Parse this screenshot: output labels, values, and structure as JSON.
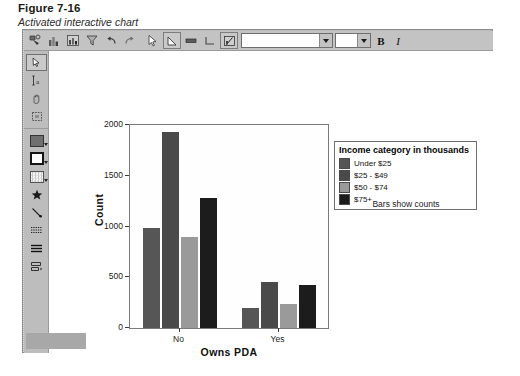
{
  "caption": {
    "figure_number": "Figure 7-16",
    "figure_title": "Activated interactive chart"
  },
  "toolbar": {
    "buttons": [
      {
        "name": "select-data-icon",
        "title": "Select Data"
      },
      {
        "name": "bar-chart-icon",
        "title": "Bar Chart"
      },
      {
        "name": "histogram-icon",
        "title": "Histogram"
      },
      {
        "name": "filter-icon",
        "title": "Filter"
      },
      {
        "name": "undo-icon",
        "title": "Undo"
      },
      {
        "name": "redo-icon",
        "title": "Redo"
      },
      {
        "name": "pointer-tool-icon",
        "title": "Arrow Tool"
      },
      {
        "name": "shape-tool-icon",
        "title": "Shape Tool"
      },
      {
        "name": "text-box-icon",
        "title": "Text Box"
      },
      {
        "name": "reference-line-icon",
        "title": "Reference Line"
      },
      {
        "name": "transpose-icon",
        "title": "Transpose Chart"
      }
    ],
    "font_value": "",
    "font_placeholder": "",
    "size_value": "",
    "bold_label": "B",
    "italic_label": "I"
  },
  "left_toolbar": {
    "items": [
      {
        "name": "arrow-select-icon"
      },
      {
        "name": "text-insert-icon"
      },
      {
        "name": "hand-pan-icon"
      },
      {
        "name": "marquee-select-icon"
      },
      {
        "name": "fill-color-icon"
      },
      {
        "name": "border-style-icon"
      },
      {
        "name": "fill-pattern-icon"
      },
      {
        "name": "marker-star-icon"
      },
      {
        "name": "line-style-icon"
      },
      {
        "name": "dash-pattern-icon"
      },
      {
        "name": "line-weight-icon"
      },
      {
        "name": "bar-label-icon"
      }
    ]
  },
  "chart_data": {
    "type": "bar",
    "title": "",
    "xlabel": "Owns PDA",
    "ylabel": "Count",
    "categories": [
      "No",
      "Yes"
    ],
    "series": [
      {
        "name": "Under $25",
        "values": [
          985,
          195
        ],
        "color": "#565656"
      },
      {
        "name": "$25 - $49",
        "values": [
          1930,
          455
        ],
        "color": "#4a4a4a"
      },
      {
        "name": "$50 - $74",
        "values": [
          895,
          235
        ],
        "color": "#9a9a9a"
      },
      {
        "name": "$75+",
        "values": [
          1280,
          425
        ],
        "color": "#1c1c1c"
      }
    ],
    "ylim": [
      0,
      2000
    ],
    "yticks": [
      0,
      500,
      1000,
      1500,
      2000
    ],
    "ytick_labels": [
      "0",
      "500",
      "1000",
      "1500",
      "2000"
    ],
    "grid": false,
    "legend_position": "right",
    "legend_title": "Income category in thousands",
    "annotation": "Bars show counts"
  }
}
